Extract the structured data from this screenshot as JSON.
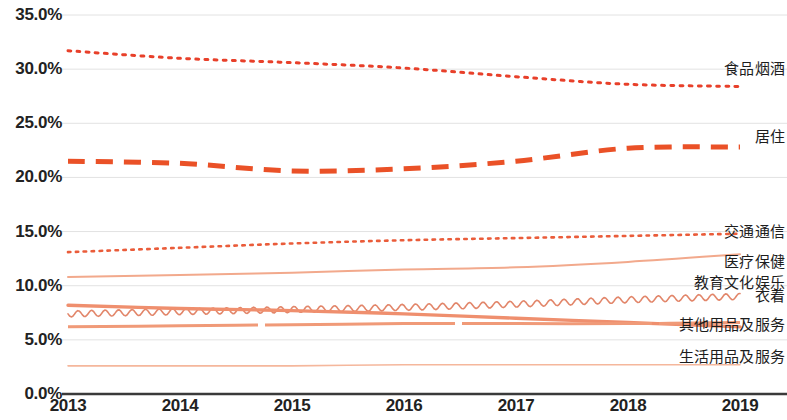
{
  "chart_data": {
    "type": "line",
    "title": "",
    "subtitle": "",
    "xlabel": "",
    "ylabel": "",
    "categories": [
      "2013",
      "2014",
      "2015",
      "2016",
      "2017",
      "2018",
      "2019"
    ],
    "x_tick_labels": [
      "2013",
      "2014",
      "2015",
      "2016",
      "2017",
      "2018",
      "2019"
    ],
    "y_tick_labels": [
      "0.0%",
      "5.0%",
      "10.0%",
      "15.0%",
      "20.0%",
      "25.0%",
      "30.0%",
      "35.0%"
    ],
    "y_tick_values": [
      0,
      5,
      10,
      15,
      20,
      25,
      30,
      35
    ],
    "ylim": [
      0,
      35
    ],
    "xlim": [
      "2013",
      "2019"
    ],
    "grid": true,
    "grid_color": "#e2e2e2",
    "axis_color": "#3a3a3a",
    "legend_position": "right-inline",
    "series": [
      {
        "name": "食品烟酒",
        "label": "食品烟酒",
        "color": "#e8402a",
        "style": "dotted",
        "width": 3.0,
        "values": [
          31.7,
          31.0,
          30.6,
          30.1,
          29.3,
          28.6,
          28.4
        ],
        "label_y_percent": 30.2
      },
      {
        "name": "居住",
        "label": "居住",
        "color": "#ea5127",
        "style": "dashed",
        "width": 5.0,
        "values": [
          21.5,
          21.3,
          20.6,
          20.8,
          21.5,
          22.7,
          22.8
        ],
        "label_y_percent": 23.9
      },
      {
        "name": "交通通信",
        "label": "交通通信",
        "color": "#ea5c3a",
        "style": "dotted",
        "width": 2.6,
        "values": [
          13.1,
          13.5,
          13.9,
          14.2,
          14.4,
          14.6,
          14.8
        ],
        "label_y_percent": 15.1
      },
      {
        "name": "医疗保健",
        "label": "医疗保健",
        "color": "#f2a98c",
        "style": "solid",
        "width": 2.0,
        "values": [
          10.8,
          11.0,
          11.2,
          11.5,
          11.7,
          12.2,
          12.9
        ],
        "label_y_percent": 12.4
      },
      {
        "name": "教育文化娱乐",
        "label": "教育文化娱乐",
        "color": "#e2866a",
        "style": "wavy",
        "width": 1.6,
        "values": [
          7.4,
          7.6,
          7.8,
          8.0,
          8.3,
          8.7,
          9.0
        ],
        "label_y_percent": 10.4
      },
      {
        "name": "衣着",
        "label": "衣着",
        "color": "#ef8f6e",
        "style": "solid",
        "width": 3.4,
        "values": [
          8.2,
          7.9,
          7.7,
          7.4,
          7.0,
          6.6,
          6.2
        ],
        "label_y_percent": 9.2
      },
      {
        "name": "其他用品及服务",
        "label": "其他用品及服务",
        "color": "#f09a78",
        "style": "solid-dashed",
        "width": 3.0,
        "values": [
          6.2,
          6.3,
          6.4,
          6.5,
          6.5,
          6.5,
          6.6
        ],
        "label_y_percent": 6.6
      },
      {
        "name": "生活用品及服务",
        "label": "生活用品及服务",
        "color": "#f5b79c",
        "style": "solid",
        "width": 1.6,
        "values": [
          2.6,
          2.6,
          2.6,
          2.7,
          2.7,
          2.7,
          2.7
        ],
        "label_y_percent": 3.6
      }
    ]
  }
}
